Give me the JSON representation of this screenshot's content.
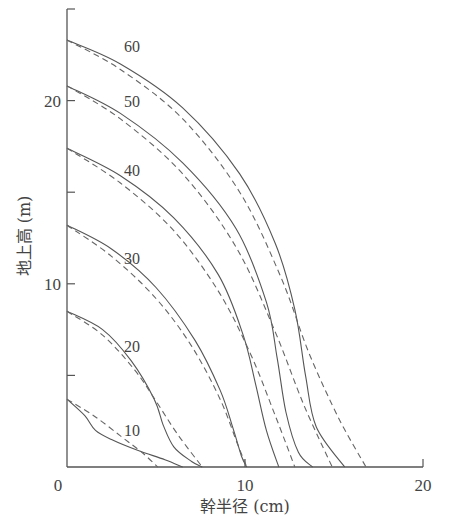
{
  "chart_data": {
    "type": "line",
    "title": "",
    "xlabel": "幹半径 (cm)",
    "ylabel": "地上高 (m)",
    "xlim": [
      0,
      20
    ],
    "ylim": [
      0,
      25
    ],
    "x_ticks": [
      0,
      10,
      20
    ],
    "y_ticks": [
      0,
      5,
      10,
      15,
      20,
      25
    ],
    "y_tick_labels": [
      "",
      "",
      "10",
      "",
      "20",
      ""
    ],
    "x_tick_labels": [
      "0",
      "10",
      "20"
    ],
    "grid": false,
    "legend": "none — curves labeled inline by tree age; solid = observed stem profile, dashed = fitted/model profile",
    "series": [
      {
        "name": "10",
        "style": "solid",
        "points": [
          [
            0,
            3.7
          ],
          [
            1.0,
            2.8
          ],
          [
            1.6,
            2.0
          ],
          [
            2.5,
            1.5
          ],
          [
            4.0,
            0.9
          ],
          [
            5.5,
            0.4
          ],
          [
            6.5,
            0.0
          ]
        ]
      },
      {
        "name": "10",
        "style": "dashed",
        "points": [
          [
            0,
            3.7
          ],
          [
            1.5,
            2.8
          ],
          [
            3.0,
            1.7
          ],
          [
            4.2,
            0.8
          ],
          [
            5.1,
            0.0
          ]
        ]
      },
      {
        "name": "20",
        "style": "solid",
        "points": [
          [
            0,
            8.5
          ],
          [
            2.0,
            7.5
          ],
          [
            3.6,
            5.8
          ],
          [
            4.9,
            3.7
          ],
          [
            5.4,
            2.3
          ],
          [
            6.0,
            1.1
          ],
          [
            7.0,
            0.3
          ],
          [
            7.6,
            0.0
          ]
        ]
      },
      {
        "name": "20",
        "style": "dashed",
        "points": [
          [
            0,
            8.5
          ],
          [
            2.0,
            7.2
          ],
          [
            3.8,
            5.3
          ],
          [
            5.0,
            3.6
          ],
          [
            6.2,
            1.8
          ],
          [
            7.6,
            0.0
          ]
        ]
      },
      {
        "name": "30",
        "style": "solid",
        "points": [
          [
            0,
            13.2
          ],
          [
            2.5,
            11.9
          ],
          [
            5.0,
            9.8
          ],
          [
            7.2,
            6.9
          ],
          [
            8.6,
            4.2
          ],
          [
            9.3,
            2.2
          ],
          [
            9.8,
            0.6
          ],
          [
            10.1,
            0.0
          ]
        ]
      },
      {
        "name": "30",
        "style": "dashed",
        "points": [
          [
            0,
            13.2
          ],
          [
            2.5,
            11.5
          ],
          [
            5.0,
            9.2
          ],
          [
            7.0,
            6.6
          ],
          [
            8.6,
            3.7
          ],
          [
            9.6,
            1.2
          ],
          [
            10.1,
            0.0
          ]
        ]
      },
      {
        "name": "40",
        "style": "solid",
        "points": [
          [
            0,
            17.4
          ],
          [
            3.0,
            15.9
          ],
          [
            6.0,
            13.6
          ],
          [
            8.5,
            10.5
          ],
          [
            9.9,
            7.2
          ],
          [
            10.6,
            4.5
          ],
          [
            11.2,
            2.0
          ],
          [
            11.9,
            0.0
          ]
        ]
      },
      {
        "name": "40",
        "style": "dashed",
        "points": [
          [
            0,
            17.4
          ],
          [
            3.0,
            15.5
          ],
          [
            6.0,
            12.9
          ],
          [
            8.5,
            9.6
          ],
          [
            10.3,
            6.2
          ],
          [
            11.7,
            2.8
          ],
          [
            12.8,
            0.0
          ]
        ]
      },
      {
        "name": "50",
        "style": "solid",
        "points": [
          [
            0,
            20.8
          ],
          [
            3.0,
            19.3
          ],
          [
            6.5,
            16.6
          ],
          [
            9.5,
            13.0
          ],
          [
            11.2,
            9.0
          ],
          [
            11.8,
            6.0
          ],
          [
            12.3,
            3.0
          ],
          [
            13.0,
            0.8
          ],
          [
            13.8,
            0.0
          ]
        ]
      },
      {
        "name": "50",
        "style": "dashed",
        "points": [
          [
            0,
            20.8
          ],
          [
            3.0,
            19.0
          ],
          [
            6.5,
            16.0
          ],
          [
            9.5,
            12.0
          ],
          [
            11.6,
            7.6
          ],
          [
            13.3,
            3.4
          ],
          [
            14.9,
            0.0
          ]
        ]
      },
      {
        "name": "60",
        "style": "solid",
        "points": [
          [
            0,
            23.3
          ],
          [
            3.0,
            22.0
          ],
          [
            6.5,
            19.6
          ],
          [
            9.7,
            16.0
          ],
          [
            11.7,
            12.2
          ],
          [
            12.8,
            8.6
          ],
          [
            13.4,
            5.0
          ],
          [
            14.0,
            2.2
          ],
          [
            15.6,
            0.0
          ]
        ]
      },
      {
        "name": "60",
        "style": "dashed",
        "points": [
          [
            0,
            23.3
          ],
          [
            3.0,
            21.7
          ],
          [
            6.5,
            19.0
          ],
          [
            9.7,
            15.0
          ],
          [
            12.0,
            10.4
          ],
          [
            13.6,
            6.2
          ],
          [
            15.3,
            2.6
          ],
          [
            16.8,
            0.0
          ]
        ]
      }
    ],
    "annotations": [
      {
        "text": "60",
        "x": 2.7,
        "y": 23.0
      },
      {
        "text": "50",
        "x": 2.7,
        "y": 20.0
      },
      {
        "text": "40",
        "x": 2.7,
        "y": 16.2
      },
      {
        "text": "30",
        "x": 2.7,
        "y": 11.4
      },
      {
        "text": "20",
        "x": 2.7,
        "y": 6.6
      },
      {
        "text": "10",
        "x": 2.7,
        "y": 2.0
      }
    ]
  }
}
